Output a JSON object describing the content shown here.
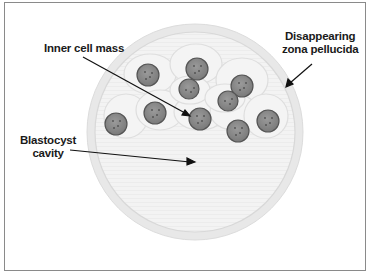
{
  "diagram": {
    "labels": {
      "inner_cell_mass": "Inner cell mass",
      "zona_line1": "Disappearing",
      "zona_line2": "zona pellucida",
      "cavity_line1": "Blastocyst",
      "cavity_line2": "cavity"
    },
    "colors": {
      "zona": "#e6e6e6",
      "cell_body": "#f1f1f1",
      "nucleus": "#8c8c8c",
      "nucleus_edge": "#5a5a5a",
      "leader": "#111111",
      "border": "#8a8a8a"
    }
  }
}
